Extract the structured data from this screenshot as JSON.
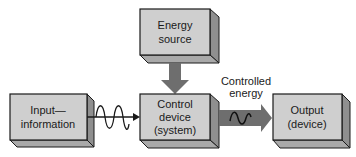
{
  "diagram": {
    "type": "block-diagram",
    "colors": {
      "box_face": "#cfcfcf",
      "box_side": "#8f8f8f",
      "box_bottom": "#a9a9a9",
      "outline": "#1a1a1a",
      "arrow_fill": "#6e6e6e",
      "background": "#ffffff"
    },
    "nodes": [
      {
        "id": "energy_source",
        "lines": [
          "Energy",
          "source"
        ]
      },
      {
        "id": "input",
        "lines": [
          "Input—",
          "information"
        ]
      },
      {
        "id": "control",
        "lines": [
          "Control",
          "device",
          "(system)"
        ]
      },
      {
        "id": "output",
        "lines": [
          "Output",
          "(device)"
        ]
      }
    ],
    "edges": [
      {
        "from": "energy_source",
        "to": "control",
        "style": "thick-gray-arrow"
      },
      {
        "from": "input",
        "to": "control",
        "style": "thin-arrow-with-sine-wave"
      },
      {
        "from": "control",
        "to": "output",
        "style": "thick-gray-arrow-with-wave",
        "label_lines": [
          "Controlled",
          "energy"
        ]
      }
    ]
  }
}
